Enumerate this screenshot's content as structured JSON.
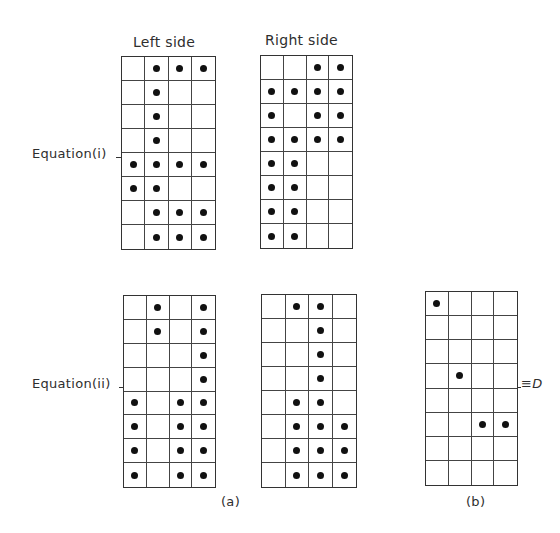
{
  "figure": {
    "headers": {
      "left": "Left side",
      "right": "Right side"
    },
    "row_labels": {
      "eq1": "Equation(i)",
      "eq2": "Equation(ii)"
    },
    "captions": {
      "a": "(a)",
      "b": "(b)"
    },
    "equiv_label": "≡D",
    "grids": {
      "eq1_left": [
        [
          0,
          1,
          1,
          1
        ],
        [
          0,
          1,
          0,
          0
        ],
        [
          0,
          1,
          0,
          0
        ],
        [
          0,
          1,
          0,
          0
        ],
        [
          1,
          1,
          1,
          1
        ],
        [
          1,
          1,
          0,
          0
        ],
        [
          0,
          1,
          1,
          1
        ],
        [
          0,
          1,
          1,
          1
        ]
      ],
      "eq1_right": [
        [
          0,
          0,
          1,
          1
        ],
        [
          1,
          1,
          1,
          1
        ],
        [
          1,
          0,
          1,
          1
        ],
        [
          1,
          1,
          1,
          1
        ],
        [
          1,
          1,
          0,
          0
        ],
        [
          1,
          1,
          0,
          0
        ],
        [
          1,
          1,
          0,
          0
        ],
        [
          1,
          1,
          0,
          0
        ]
      ],
      "eq2_left": [
        [
          0,
          1,
          0,
          1
        ],
        [
          0,
          1,
          0,
          1
        ],
        [
          0,
          0,
          0,
          1
        ],
        [
          0,
          0,
          0,
          1
        ],
        [
          1,
          0,
          1,
          1
        ],
        [
          1,
          0,
          1,
          1
        ],
        [
          1,
          0,
          1,
          1
        ],
        [
          1,
          0,
          1,
          1
        ]
      ],
      "eq2_right": [
        [
          0,
          1,
          1,
          0
        ],
        [
          0,
          0,
          1,
          0
        ],
        [
          0,
          0,
          1,
          0
        ],
        [
          0,
          0,
          1,
          0
        ],
        [
          0,
          1,
          1,
          0
        ],
        [
          0,
          1,
          1,
          1
        ],
        [
          0,
          1,
          1,
          1
        ],
        [
          0,
          1,
          1,
          1
        ]
      ],
      "result_D": [
        [
          1,
          0,
          0,
          0
        ],
        [
          0,
          0,
          0,
          0
        ],
        [
          0,
          0,
          0,
          0
        ],
        [
          0,
          1,
          0,
          0
        ],
        [
          0,
          0,
          0,
          0
        ],
        [
          0,
          0,
          1,
          1
        ],
        [
          0,
          0,
          0,
          0
        ],
        [
          0,
          0,
          0,
          0
        ]
      ]
    }
  }
}
